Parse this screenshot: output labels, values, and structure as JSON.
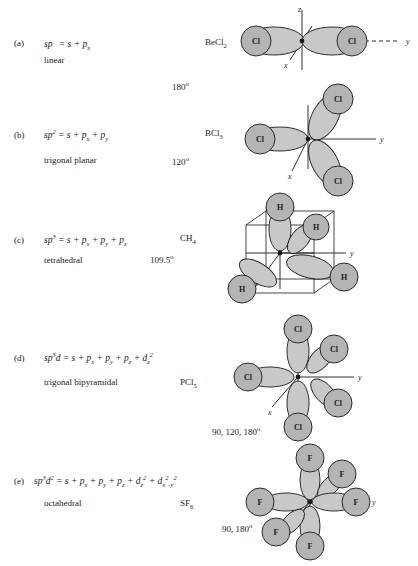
{
  "figure": {
    "colors": {
      "lobe_fill": "#c8c8c8",
      "atom_fill": "#b4b4b4",
      "stroke": "#1a1a1a",
      "background": "#ffffff"
    }
  },
  "rows": [
    {
      "key": "a",
      "label": "(a)",
      "formula_html": "sp <sup>&nbsp;</sup> = s + p<sub>x</sub>",
      "hybrid": "sp",
      "components": [
        "s",
        "p_x"
      ],
      "geometry": "linear",
      "molecule_html": "BeCl<sub>2</sub>",
      "molecule": "BeCl2",
      "angles_html": "180<sup>o</sup>",
      "angles": "180°",
      "central_atom": "Be",
      "ligands": [
        "Cl",
        "Cl"
      ],
      "axes": [
        "z",
        "x",
        "y"
      ]
    },
    {
      "key": "b",
      "label": "(b)",
      "formula_html": "sp<sup>2</sup> = s + p<sub>x</sub> + p<sub>y</sub>",
      "hybrid": "sp2",
      "components": [
        "s",
        "p_x",
        "p_y"
      ],
      "geometry": "trigonal planar",
      "molecule_html": "BCl<sub>3</sub>",
      "molecule": "BCl3",
      "angles_html": "120<sup>o</sup>",
      "angles": "120°",
      "central_atom": "B",
      "ligands": [
        "Cl",
        "Cl",
        "Cl"
      ],
      "axes": [
        "y",
        "x"
      ]
    },
    {
      "key": "c",
      "label": "(c)",
      "formula_html": "sp<sup>3</sup> = s + p<sub>x</sub> + p<sub>y</sub> + p<sub>z</sub>",
      "hybrid": "sp3",
      "components": [
        "s",
        "p_x",
        "p_y",
        "p_z"
      ],
      "geometry": "tetrahedral",
      "molecule_html": "CH<sub>4</sub>",
      "molecule": "CH4",
      "angles_html": "109.5<sup>o</sup>",
      "angles": "109.5°",
      "central_atom": "C",
      "ligands": [
        "H",
        "H",
        "H",
        "H"
      ],
      "axes": [
        "y",
        "x"
      ]
    },
    {
      "key": "d",
      "label": "(d)",
      "formula_html": "sp<sup>3</sup>d = s + p<sub>x</sub> + p<sub>y</sub> + p<sub>z</sub> + d<sub>z</sub><sup>2</sup>",
      "hybrid": "sp3d",
      "components": [
        "s",
        "p_x",
        "p_y",
        "p_z",
        "d_z2"
      ],
      "geometry": "trigonal  bipyramidal",
      "molecule_html": "PCl<sub>5</sub>",
      "molecule": "PCl5",
      "angles_html": "90, 120, 180<sup>o</sup>",
      "angles": "90, 120, 180°",
      "central_atom": "P",
      "ligands": [
        "Cl",
        "Cl",
        "Cl",
        "Cl",
        "Cl"
      ],
      "axes": [
        "y",
        "x"
      ]
    },
    {
      "key": "e",
      "label": "(e)",
      "formula_html": "sp<sup>3</sup>d<sup>2</sup> = s + p<sub>x</sub> + p<sub>y</sub> + p<sub>z</sub> + d<sub>z</sub><sup>2</sup> + d<sub>x</sub><sup>2</sup><sub>-y</sub><sup>2</sup>",
      "hybrid": "sp3d2",
      "components": [
        "s",
        "p_x",
        "p_y",
        "p_z",
        "d_z2",
        "d_x2-y2"
      ],
      "geometry": "octahedral",
      "molecule_html": "SF<sub>6</sub>",
      "molecule": "SF6",
      "angles_html": "90, 180<sup>o</sup>",
      "angles": "90, 180°",
      "central_atom": "S",
      "ligands": [
        "F",
        "F",
        "F",
        "F",
        "F",
        "F"
      ],
      "axes": [
        "z",
        "y",
        "x"
      ]
    }
  ],
  "atom_labels": {
    "cl": "Cl",
    "h": "H",
    "f": "F",
    "be": "Be"
  },
  "axis_labels": {
    "x": "x",
    "y": "y",
    "z": "z"
  }
}
